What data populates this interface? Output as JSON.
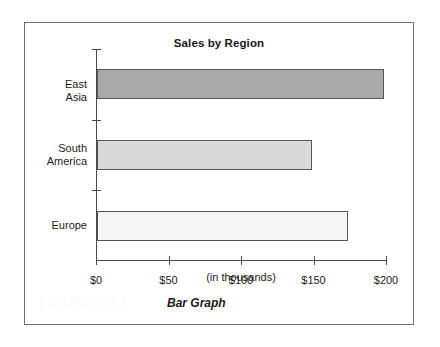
{
  "figure": {
    "number_label": "FIGURE 12.3.",
    "caption": "Bar Graph"
  },
  "chart_data": {
    "type": "bar",
    "orientation": "horizontal",
    "title": "Sales by Region",
    "xlabel": "(in thousands)",
    "ylabel": "",
    "categories": [
      "East Asia",
      "South America",
      "Europe"
    ],
    "values": [
      198,
      148,
      173
    ],
    "xlim": [
      0,
      200
    ],
    "xticks": [
      0,
      50,
      100,
      150,
      200
    ],
    "xticklabels": [
      "$0",
      "$50",
      "$100",
      "$150",
      "$200"
    ],
    "grid": false,
    "legend": false,
    "bar_colors": [
      "#a9a9a9",
      "#d9d9d9",
      "#f6f6f6"
    ],
    "bar_border_color": "#555555",
    "series": [
      {
        "name": "Sales",
        "points": [
          {
            "category": "East Asia",
            "label": "East Asia",
            "value": 198,
            "color": "#a9a9a9"
          },
          {
            "category": "South America",
            "label": "South\nAmerica",
            "value": 148,
            "color": "#d9d9d9"
          },
          {
            "category": "Europe",
            "label": "Europe",
            "value": 173,
            "color": "#f6f6f6"
          }
        ]
      }
    ]
  }
}
